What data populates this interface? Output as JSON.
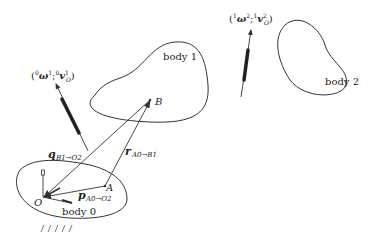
{
  "diagram": {
    "bodies": [
      {
        "id": "body0",
        "label": "body 0"
      },
      {
        "id": "body1",
        "label": "body 1"
      },
      {
        "id": "body2",
        "label": "body 2"
      }
    ],
    "points": {
      "O": "O",
      "A": "A",
      "B": "B"
    },
    "vectors": {
      "q": {
        "symbol": "q",
        "sub": "B1→O2"
      },
      "r": {
        "symbol": "r",
        "sub": "A0→B1"
      },
      "p": {
        "symbol": "p",
        "sub": "A0→O2"
      }
    },
    "twists": {
      "twist01": {
        "open": "(",
        "sup1": "0",
        "omega": "ω",
        "sup_omega": "1",
        "sep": ";",
        "sup2": "0",
        "v": "v",
        "sup_v": "1",
        "sub_v": "O",
        "close": ")"
      },
      "twist12": {
        "open": "(",
        "sup1": "1",
        "omega": "ω",
        "sup_omega": "2",
        "sep": ";",
        "sup2": "1",
        "v": "v",
        "sup_v": "2",
        "sub_v": "O",
        "close": ")"
      }
    },
    "colors": {
      "line": "#333333",
      "text": "#222222",
      "background": "#ffffff"
    }
  }
}
